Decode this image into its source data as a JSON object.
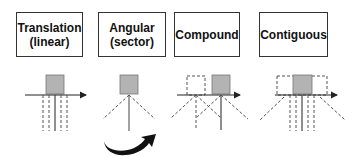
{
  "panels": [
    {
      "id": "translation",
      "title_line1": "Translation",
      "title_line2": "(linear)"
    },
    {
      "id": "angular",
      "title_line1": "Angular",
      "title_line2": "(sector)"
    },
    {
      "id": "compound",
      "title_line1": "Compound",
      "title_line2": ""
    },
    {
      "id": "contiguous",
      "title_line1": "Contiguous",
      "title_line2": ""
    }
  ],
  "colors": {
    "box_fill": "#b3b3b3",
    "stroke": "#333333",
    "dashed": "#555555",
    "arrow_fill": "#111111"
  },
  "icons": {
    "rotation_arrow": "curved-rotation-arrow"
  }
}
